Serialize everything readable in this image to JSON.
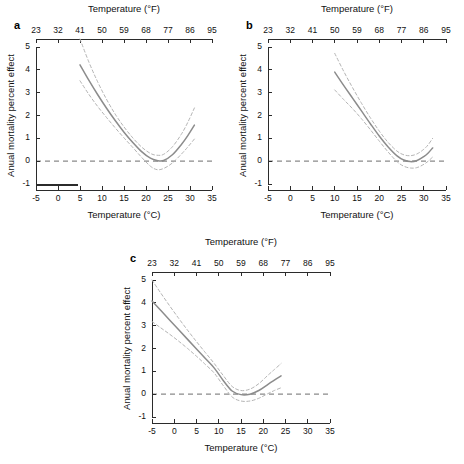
{
  "figure": {
    "panels": [
      {
        "id": "a",
        "label": "a",
        "top_axis_title": "Temperature (°F)",
        "bottom_axis_title": "Temperature (°C)",
        "y_axis_title": "Anual mortality percent effect",
        "has_rug": true,
        "rug_range": [
          -5,
          4.5
        ]
      },
      {
        "id": "b",
        "label": "b",
        "top_axis_title": "Temperature (°F)",
        "bottom_axis_title": "Temperature (°C)",
        "y_axis_title": "Anual mortality percent effect",
        "has_rug": false,
        "rug_range": null
      },
      {
        "id": "c",
        "label": "c",
        "top_axis_title": "Temperature (°F)",
        "bottom_axis_title": "Temperature (°C)",
        "y_axis_title": "Anual mortality percent effect",
        "has_rug": false,
        "rug_range": null
      }
    ],
    "colors": {
      "fit_line": "#8c8c8c",
      "ci_line": "#b4b4b4",
      "zero_line": "#8a8a8a",
      "axis": "#2b2b2b",
      "background": "#ffffff"
    }
  },
  "chart_data": [
    {
      "type": "line",
      "title": "a",
      "panel": "a",
      "xlabel": "Temperature (°C)",
      "ylabel": "Anual mortality percent effect",
      "xlabel_top": "Temperature (°F)",
      "xlim": [
        -5,
        35
      ],
      "ylim": [
        -1,
        5
      ],
      "xticks": [
        -5,
        0,
        5,
        10,
        15,
        20,
        25,
        30,
        35
      ],
      "xticklabels": [
        "-5",
        "0",
        "5",
        "10",
        "15",
        "20",
        "25",
        "30",
        "35"
      ],
      "xticks_top": [
        23,
        32,
        41,
        50,
        59,
        68,
        77,
        86,
        95
      ],
      "xticklabels_top": [
        "23",
        "32",
        "41",
        "50",
        "59",
        "68",
        "77",
        "86",
        "95"
      ],
      "yticks": [
        -1,
        0,
        1,
        2,
        3,
        4,
        5
      ],
      "yticklabels": [
        "-1",
        "0",
        "1",
        "2",
        "3",
        "4",
        "5"
      ],
      "grid": false,
      "legend": "none",
      "reference_line_y": 0,
      "series": [
        {
          "name": "estimate",
          "style": "solid",
          "x": [
            5.0,
            7.0,
            9.0,
            11.0,
            13.0,
            15.0,
            17.0,
            19.0,
            21.0,
            22.5,
            24.0,
            26.0,
            28.0,
            29.5,
            31.0
          ],
          "values": [
            4.22,
            3.55,
            2.92,
            2.33,
            1.78,
            1.27,
            0.82,
            0.42,
            0.13,
            0.03,
            0.03,
            0.28,
            0.72,
            1.12,
            1.58
          ]
        },
        {
          "name": "upper_95ci",
          "style": "dashed",
          "x": [
            5.0,
            7.0,
            9.0,
            11.0,
            13.0,
            15.0,
            17.0,
            19.0,
            21.0,
            22.5,
            24.0,
            26.0,
            28.0,
            29.5,
            31.0
          ],
          "values": [
            5.35,
            4.35,
            3.48,
            2.72,
            2.06,
            1.5,
            1.02,
            0.62,
            0.34,
            0.26,
            0.3,
            0.63,
            1.17,
            1.7,
            2.33
          ]
        },
        {
          "name": "lower_95ci",
          "style": "dashed",
          "x": [
            5.0,
            7.0,
            9.0,
            11.0,
            13.0,
            15.0,
            17.0,
            19.0,
            21.0,
            22.5,
            24.0,
            26.0,
            28.0,
            29.5,
            31.0
          ],
          "values": [
            3.52,
            2.93,
            2.4,
            1.92,
            1.46,
            1.02,
            0.6,
            0.17,
            -0.22,
            -0.37,
            -0.32,
            -0.08,
            0.3,
            0.62,
            0.97
          ]
        }
      ]
    },
    {
      "type": "line",
      "title": "b",
      "panel": "b",
      "xlabel": "Temperature (°C)",
      "ylabel": "Anual mortality percent effect",
      "xlabel_top": "Temperature (°F)",
      "xlim": [
        -5,
        35
      ],
      "ylim": [
        -1,
        5
      ],
      "xticks": [
        -5,
        0,
        5,
        10,
        15,
        20,
        25,
        30,
        35
      ],
      "xticklabels": [
        "-5",
        "0",
        "5",
        "10",
        "15",
        "20",
        "25",
        "30",
        "35"
      ],
      "xticks_top": [
        23,
        32,
        41,
        50,
        59,
        68,
        77,
        86,
        95
      ],
      "xticklabels_top": [
        "23",
        "32",
        "41",
        "50",
        "59",
        "68",
        "77",
        "86",
        "95"
      ],
      "yticks": [
        -1,
        0,
        1,
        2,
        3,
        4,
        5
      ],
      "yticklabels": [
        "-1",
        "0",
        "1",
        "2",
        "3",
        "4",
        "5"
      ],
      "grid": false,
      "legend": "none",
      "reference_line_y": 0,
      "series": [
        {
          "name": "estimate",
          "style": "solid",
          "x": [
            10.0,
            12.0,
            14.0,
            16.0,
            18.0,
            20.0,
            22.0,
            24.0,
            25.5,
            27.0,
            28.5,
            30.0,
            31.0,
            32.0
          ],
          "values": [
            3.9,
            3.32,
            2.76,
            2.2,
            1.64,
            1.1,
            0.62,
            0.23,
            0.05,
            -0.02,
            0.03,
            0.2,
            0.36,
            0.58
          ]
        },
        {
          "name": "upper_95ci",
          "style": "dashed",
          "x": [
            10.0,
            12.0,
            14.0,
            16.0,
            18.0,
            20.0,
            22.0,
            24.0,
            25.5,
            27.0,
            28.5,
            30.0,
            31.0,
            32.0
          ],
          "values": [
            4.72,
            3.94,
            3.22,
            2.54,
            1.9,
            1.32,
            0.82,
            0.44,
            0.28,
            0.24,
            0.32,
            0.52,
            0.72,
            1.0
          ]
        },
        {
          "name": "lower_95ci",
          "style": "dashed",
          "x": [
            10.0,
            12.0,
            14.0,
            16.0,
            18.0,
            20.0,
            22.0,
            24.0,
            25.5,
            27.0,
            28.5,
            30.0,
            31.0,
            32.0
          ],
          "values": [
            3.12,
            2.7,
            2.3,
            1.86,
            1.38,
            0.88,
            0.4,
            -0.02,
            -0.22,
            -0.3,
            -0.28,
            -0.14,
            0.0,
            0.18
          ]
        }
      ]
    },
    {
      "type": "line",
      "title": "c",
      "panel": "c",
      "xlabel": "Temperature (°C)",
      "ylabel": "Anual mortality percent effect",
      "xlabel_top": "Temperature (°F)",
      "xlim": [
        -5,
        35
      ],
      "ylim": [
        -1,
        5
      ],
      "xticks": [
        -5,
        0,
        5,
        10,
        15,
        20,
        25,
        30,
        35
      ],
      "xticklabels": [
        "-5",
        "0",
        "5",
        "10",
        "15",
        "20",
        "25",
        "30",
        "35"
      ],
      "xticks_top": [
        23,
        32,
        41,
        50,
        59,
        68,
        77,
        86,
        95
      ],
      "xticklabels_top": [
        "23",
        "32",
        "41",
        "50",
        "59",
        "68",
        "77",
        "86",
        "95"
      ],
      "yticks": [
        -1,
        0,
        1,
        2,
        3,
        4,
        5
      ],
      "yticklabels": [
        "-1",
        "0",
        "1",
        "2",
        "3",
        "4",
        "5"
      ],
      "grid": false,
      "legend": "none",
      "reference_line_y": 0,
      "series": [
        {
          "name": "estimate",
          "style": "solid",
          "x": [
            -5.0,
            -3.0,
            -1.0,
            1.0,
            3.0,
            5.0,
            7.0,
            9.0,
            11.0,
            13.0,
            15.0,
            17.0,
            19.0,
            21.0,
            22.5,
            24.0
          ],
          "values": [
            4.08,
            3.66,
            3.24,
            2.82,
            2.4,
            1.98,
            1.56,
            1.14,
            0.6,
            0.14,
            -0.02,
            0.0,
            0.16,
            0.42,
            0.62,
            0.8
          ]
        },
        {
          "name": "upper_95ci",
          "style": "dashed",
          "x": [
            -5.0,
            -3.0,
            -1.0,
            1.0,
            3.0,
            5.0,
            7.0,
            9.0,
            11.0,
            13.0,
            15.0,
            17.0,
            19.0,
            21.0,
            22.5,
            24.0
          ],
          "values": [
            5.0,
            4.42,
            3.86,
            3.32,
            2.8,
            2.3,
            1.82,
            1.34,
            0.82,
            0.34,
            0.16,
            0.22,
            0.46,
            0.82,
            1.08,
            1.34
          ]
        },
        {
          "name": "lower_95ci",
          "style": "dashed",
          "x": [
            -5.0,
            -3.0,
            -1.0,
            1.0,
            3.0,
            5.0,
            7.0,
            9.0,
            11.0,
            13.0,
            15.0,
            17.0,
            19.0,
            21.0,
            22.5,
            24.0
          ],
          "values": [
            3.18,
            2.9,
            2.62,
            2.32,
            2.0,
            1.66,
            1.3,
            0.92,
            0.38,
            -0.12,
            -0.3,
            -0.3,
            -0.18,
            0.02,
            0.16,
            0.28
          ]
        }
      ]
    }
  ]
}
